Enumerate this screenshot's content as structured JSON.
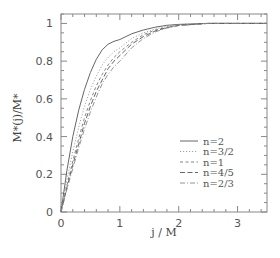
{
  "chart_data": {
    "type": "line",
    "title": "",
    "xlabel": "j / M",
    "ylabel": "M*(j)/M*",
    "xlim": [
      0,
      3.5
    ],
    "ylim": [
      0,
      1.05
    ],
    "xticks": [
      0,
      1,
      2,
      3
    ],
    "yticks": [
      0,
      0.2,
      0.4,
      0.6,
      0.8,
      1
    ],
    "xtick_labels": [
      "0",
      "1",
      "2",
      "3"
    ],
    "ytick_labels": [
      "0",
      "0.2",
      "0.4",
      "0.6",
      "0.8",
      "1"
    ],
    "grid": false,
    "legend_position": "lower right",
    "x": [
      0,
      0.1,
      0.2,
      0.3,
      0.4,
      0.5,
      0.6,
      0.7,
      0.8,
      0.9,
      1.0,
      1.2,
      1.4,
      1.6,
      1.8,
      2.0,
      2.5,
      3.0,
      3.5
    ],
    "series": [
      {
        "name": "n=2",
        "style": "solid",
        "color": "#555555",
        "values": [
          0,
          0.22,
          0.4,
          0.54,
          0.65,
          0.74,
          0.81,
          0.86,
          0.89,
          0.905,
          0.915,
          0.945,
          0.965,
          0.98,
          0.99,
          0.995,
          1.0,
          1.0,
          1.0
        ]
      },
      {
        "name": "n=3/2",
        "style": "dotted",
        "color": "#999999",
        "values": [
          0,
          0.17,
          0.32,
          0.45,
          0.56,
          0.65,
          0.72,
          0.78,
          0.82,
          0.85,
          0.87,
          0.92,
          0.95,
          0.97,
          0.985,
          0.993,
          1.0,
          1.0,
          1.0
        ]
      },
      {
        "name": "n=1",
        "style": "dashed",
        "color": "#777777",
        "values": [
          0,
          0.14,
          0.27,
          0.39,
          0.5,
          0.59,
          0.67,
          0.73,
          0.78,
          0.82,
          0.85,
          0.9,
          0.94,
          0.965,
          0.98,
          0.99,
          1.0,
          1.0,
          1.0
        ]
      },
      {
        "name": "n=4/5",
        "style": "long-dash",
        "color": "#555555",
        "values": [
          0,
          0.13,
          0.25,
          0.36,
          0.47,
          0.56,
          0.64,
          0.7,
          0.76,
          0.8,
          0.83,
          0.89,
          0.93,
          0.96,
          0.978,
          0.99,
          1.0,
          1.0,
          1.0
        ]
      },
      {
        "name": "n=2/3",
        "style": "dash-dot",
        "color": "#888888",
        "values": [
          0,
          0.12,
          0.23,
          0.34,
          0.44,
          0.53,
          0.61,
          0.68,
          0.73,
          0.77,
          0.8,
          0.87,
          0.92,
          0.955,
          0.975,
          0.988,
          1.0,
          1.0,
          1.0
        ]
      }
    ]
  }
}
